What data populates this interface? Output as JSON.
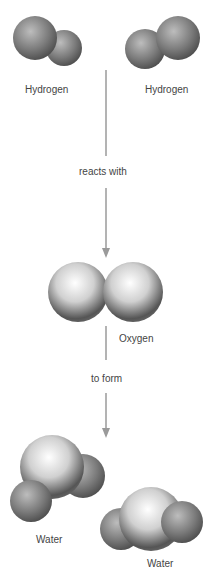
{
  "labels": {
    "hydrogen_left": "Hydrogen",
    "hydrogen_right": "Hydrogen",
    "reacts_with": "reacts with",
    "oxygen": "Oxygen",
    "to_form": "to form",
    "water_left": "Water",
    "water_right": "Water"
  },
  "colors": {
    "arrow": "#9a9a9a",
    "text": "#444444",
    "sphere_dark": "#3a3a3a",
    "sphere_light": "#f5f5f5"
  }
}
